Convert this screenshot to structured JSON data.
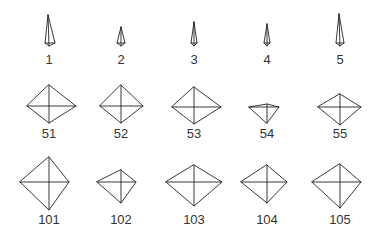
{
  "figure": {
    "rows": [
      {
        "name": "row-1",
        "items": [
          {
            "label": "1",
            "cx": 49,
            "label_y": 64
          },
          {
            "label": "2",
            "cx": 121,
            "label_y": 64
          },
          {
            "label": "3",
            "cx": 194,
            "label_y": 64
          },
          {
            "label": "4",
            "cx": 267,
            "label_y": 64
          },
          {
            "label": "5",
            "cx": 340,
            "label_y": 64
          }
        ]
      },
      {
        "name": "row-2",
        "items": [
          {
            "label": "51",
            "cx": 49,
            "label_y": 138
          },
          {
            "label": "52",
            "cx": 121,
            "label_y": 138
          },
          {
            "label": "53",
            "cx": 194,
            "label_y": 138
          },
          {
            "label": "54",
            "cx": 267,
            "label_y": 138
          },
          {
            "label": "55",
            "cx": 340,
            "label_y": 138
          }
        ]
      },
      {
        "name": "row-3",
        "items": [
          {
            "label": "101",
            "cx": 49,
            "label_y": 224
          },
          {
            "label": "102",
            "cx": 121,
            "label_y": 224
          },
          {
            "label": "103",
            "cx": 194,
            "label_y": 224
          },
          {
            "label": "104",
            "cx": 267,
            "label_y": 224
          },
          {
            "label": "105",
            "cx": 340,
            "label_y": 224
          }
        ]
      }
    ],
    "stroke_color": "#222222",
    "label_color": "#333333",
    "background": "#ffffff"
  }
}
